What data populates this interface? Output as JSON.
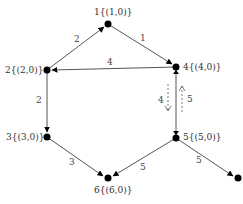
{
  "diagram": {
    "type": "directed-weighted-graph",
    "colors": {
      "edge": "#555555",
      "node": "#000000",
      "text": "#333333"
    },
    "nodes": [
      {
        "id": "1",
        "label": "1{(1,0)}",
        "x": 108,
        "y": 24
      },
      {
        "id": "2",
        "label": "2{(2,0)}",
        "x": 47,
        "y": 70
      },
      {
        "id": "4",
        "label": "4{(4,0)}",
        "x": 176,
        "y": 67
      },
      {
        "id": "3",
        "label": "3{(3,0)}",
        "x": 47,
        "y": 137
      },
      {
        "id": "5",
        "label": "5{(5,0)}",
        "x": 176,
        "y": 138
      },
      {
        "id": "6",
        "label": "6{(6,0)}",
        "x": 108,
        "y": 178
      },
      {
        "id": "7",
        "label": "",
        "x": 238,
        "y": 178
      }
    ],
    "edges": [
      {
        "from": "2",
        "to": "1",
        "weight": "2"
      },
      {
        "from": "1",
        "to": "4",
        "weight": "1"
      },
      {
        "from": "4",
        "to": "2",
        "weight": "4"
      },
      {
        "from": "2",
        "to": "3",
        "weight": "2"
      },
      {
        "from": "5",
        "to": "4",
        "weight": ""
      },
      {
        "from": "4",
        "to": "5",
        "weight": ""
      },
      {
        "from": "3",
        "to": "6",
        "weight": "3"
      },
      {
        "from": "5",
        "to": "6",
        "weight": "5"
      },
      {
        "from": "5",
        "to": "7",
        "weight": "5"
      }
    ],
    "dashed_flows": [
      {
        "direction": "down",
        "label": "4"
      },
      {
        "direction": "up",
        "label": "5"
      }
    ],
    "text": {
      "n1": "1{(1,0)}",
      "n2": "2{(2,0)}",
      "n3": "3{(3,0)}",
      "n4": "4{(4,0)}",
      "n5": "5{(5,0)}",
      "n6": "6{(6,0)}",
      "w_2_1": "2",
      "w_1_4": "1",
      "w_4_2": "4",
      "w_2_3": "2",
      "w_3_6": "3",
      "w_5_6": "5",
      "w_5_7": "5",
      "flow_down": "4",
      "flow_up": "5"
    }
  }
}
